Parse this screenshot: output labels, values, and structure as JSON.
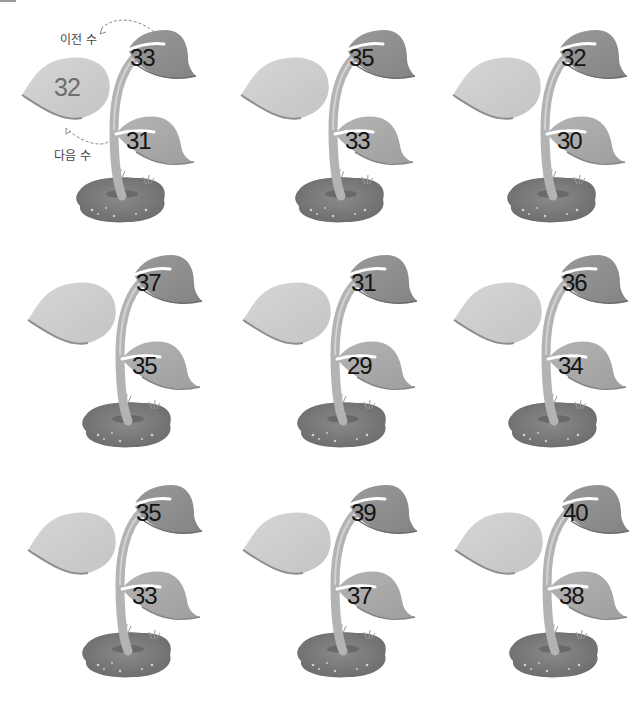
{
  "colors": {
    "leaf_light": "#cfcfcf",
    "leaf_dark": "#8f8f8f",
    "leaf_mid": "#a9a9a9",
    "stem": "#bdbdbd",
    "soil": "#7a7a7a",
    "number_text": "#141414",
    "example_number_text": "#6e6e6e",
    "annotation_text": "#444444"
  },
  "example": {
    "prev_label": "이전 수",
    "next_label": "다음 수",
    "center_value": "32"
  },
  "plants": [
    {
      "top": "33",
      "left": "32",
      "low": "31"
    },
    {
      "top": "35",
      "left": "",
      "low": "33"
    },
    {
      "top": "32",
      "left": "",
      "low": "30"
    },
    {
      "top": "37",
      "left": "",
      "low": "35"
    },
    {
      "top": "31",
      "left": "",
      "low": "29"
    },
    {
      "top": "36",
      "left": "",
      "low": "34"
    },
    {
      "top": "35",
      "left": "",
      "low": "33"
    },
    {
      "top": "39",
      "left": "",
      "low": "37"
    },
    {
      "top": "40",
      "left": "",
      "low": "38"
    }
  ]
}
